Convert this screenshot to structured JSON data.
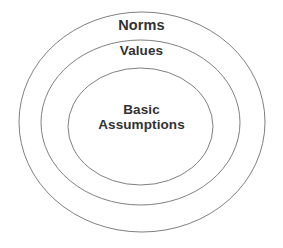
{
  "diagram": {
    "type": "concentric-ellipses",
    "background_color": "#ffffff",
    "stroke_color": "#808080",
    "text_color": "#323232",
    "layers": [
      {
        "name": "norms",
        "label": "Norms",
        "order": 1,
        "position": "outer",
        "ellipse": {
          "cx": 142,
          "cy": 122,
          "rx": 123,
          "ry": 110
        }
      },
      {
        "name": "values",
        "label": "Values",
        "order": 2,
        "position": "middle",
        "ellipse": {
          "cx": 140.5,
          "cy": 122.5,
          "rx": 99.5,
          "ry": 82.5
        }
      },
      {
        "name": "basic-assumptions",
        "label": "Basic Assumptions",
        "label_line_1": "Basic",
        "label_line_2": "Assumptions",
        "order": 3,
        "position": "inner",
        "ellipse": {
          "cx": 140.5,
          "cy": 126.5,
          "rx": 72.5,
          "ry": 58.5
        }
      }
    ]
  }
}
